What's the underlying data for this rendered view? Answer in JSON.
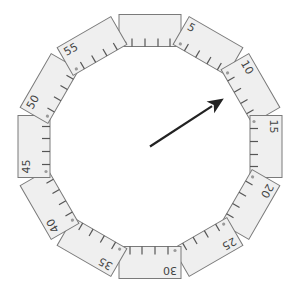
{
  "dial": {
    "segments": [
      {
        "label": ""
      },
      {
        "label": "5"
      },
      {
        "label": "10"
      },
      {
        "label": "15"
      },
      {
        "label": "20"
      },
      {
        "label": "25"
      },
      {
        "label": "30"
      },
      {
        "label": "35"
      },
      {
        "label": "40"
      },
      {
        "label": "45"
      },
      {
        "label": "50"
      },
      {
        "label": "55"
      }
    ],
    "ticks_per_segment": 4,
    "arrow": {
      "points_to_value": 9.5
    }
  },
  "colors": {
    "segment_fill": "#efefef",
    "segment_stroke": "#7a7a7a",
    "arrow": "#222222"
  }
}
